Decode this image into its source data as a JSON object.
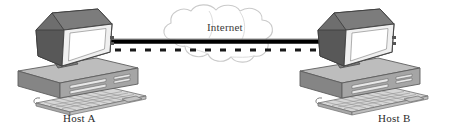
{
  "diagram": {
    "background_color": "#ffffff",
    "nodes": [
      {
        "id": "host-a",
        "label": "Host A",
        "type": "desktop-computer",
        "position": "left"
      },
      {
        "id": "host-b",
        "label": "Host B",
        "type": "desktop-computer",
        "position": "right"
      }
    ],
    "cloud": {
      "label": "Internet",
      "type": "network-cloud",
      "outline_color": "#c9c9c9"
    },
    "links": [
      {
        "id": "solid-link",
        "style": "solid",
        "color": "#000000",
        "thickness": 4
      },
      {
        "id": "dashed-link",
        "style": "dashed",
        "color": "#1a1a1a",
        "thickness": 3
      }
    ],
    "colors": {
      "monitor_dark": "#6e6e6e",
      "monitor_shadow": "#4f4f4f",
      "bezel_light": "#f2f2f2",
      "screen": "#ffffff",
      "case_top": "#b5b5b5",
      "case_front": "#9a9a9a",
      "case_side": "#7d7d7d",
      "keyboard": "#d0d0d0",
      "outline": "#4a4a4a"
    }
  }
}
